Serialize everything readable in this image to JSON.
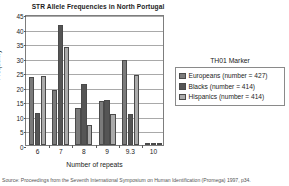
{
  "chart_data": {
    "type": "bar",
    "title": "STR Allele Frequencies in North Portugal",
    "xlabel": "Number of repeats",
    "ylabel": "Frequency",
    "categories": [
      "6",
      "7",
      "8",
      "9",
      "9.3",
      "10"
    ],
    "ylim": [
      0,
      45
    ],
    "yticks": [
      "0",
      "5",
      "10",
      "15",
      "20",
      "25",
      "30",
      "35",
      "40",
      "45"
    ],
    "grid": true,
    "legend_position": "right",
    "legend_title": "TH01 Marker",
    "series": [
      {
        "name": "Europeans (number = 427)",
        "short_name": "Europeans",
        "count": "427",
        "color": "#7b7b7b",
        "values": [
          23.4,
          18.8,
          12.6,
          15.0,
          29.3,
          0.7
        ]
      },
      {
        "name": "Blacks (number = 414)",
        "short_name": "Blacks",
        "count": "414",
        "color": "#555555",
        "values": [
          11.0,
          41.2,
          20.8,
          15.3,
          10.7,
          0.8
        ]
      },
      {
        "name": "Hispanics (number = 414)",
        "short_name": "Hispanics",
        "count": "414",
        "color": "#ababab",
        "values": [
          23.6,
          33.8,
          7.0,
          10.6,
          24.2,
          0.5
        ]
      }
    ]
  },
  "source_note": "Source: Proceedings from the Seventh International Symposium on Human Identification (Promega) 1997, p34."
}
